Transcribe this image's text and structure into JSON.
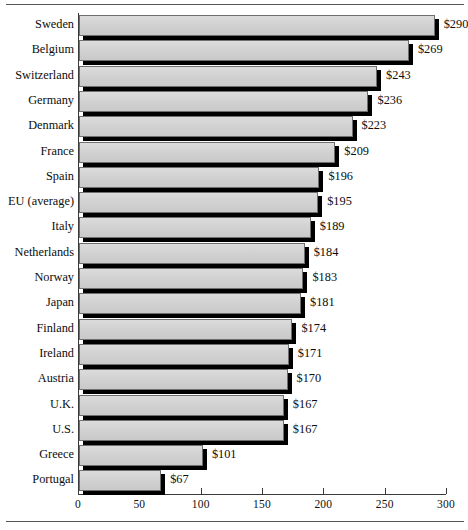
{
  "chart_data": {
    "type": "bar",
    "orientation": "horizontal",
    "title": "",
    "subtitle": "",
    "xlabel": "",
    "ylabel": "",
    "xlim": [
      0,
      300
    ],
    "xticks": [
      0,
      50,
      100,
      150,
      200,
      250,
      300
    ],
    "xticklabels": [
      "0",
      "50",
      "100",
      "150",
      "200",
      "250",
      "300"
    ],
    "grid": false,
    "legend": null,
    "value_prefix": "$",
    "categories": [
      "Sweden",
      "Belgium",
      "Switzerland",
      "Germany",
      "Denmark",
      "France",
      "Spain",
      "EU (average)",
      "Italy",
      "Netherlands",
      "Norway",
      "Japan",
      "Finland",
      "Ireland",
      "Austria",
      "U.K.",
      "U.S.",
      "Greece",
      "Portugal"
    ],
    "values": [
      290,
      269,
      243,
      236,
      223,
      209,
      196,
      195,
      189,
      184,
      183,
      181,
      174,
      171,
      170,
      167,
      167,
      101,
      67
    ],
    "value_labels": [
      "$290",
      "$269",
      "$243",
      "$236",
      "$223",
      "$209",
      "$196",
      "$195",
      "$189",
      "$184",
      "$183",
      "$181",
      "$174",
      "$171",
      "$170",
      "$167",
      "$167",
      "$101",
      "$67"
    ],
    "colors": {
      "bar_face": "#d2d2d2",
      "bar_edge": "#6e6e6e",
      "bar_shadow": "#000000",
      "axis": "#3a3a3a",
      "text": "#0d0d0d",
      "background": "#ffffff",
      "rule": "#555555"
    }
  }
}
